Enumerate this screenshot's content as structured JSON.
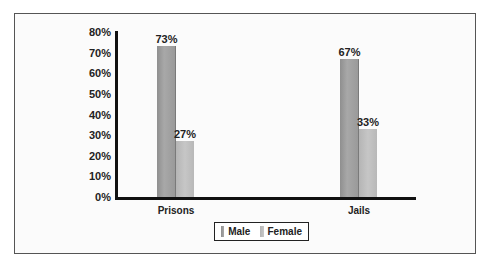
{
  "chart_data": {
    "type": "bar",
    "title": "",
    "xlabel": "",
    "ylabel": "",
    "categories": [
      "Prisons",
      "Jails"
    ],
    "series": [
      {
        "name": "Male",
        "values": [
          73,
          67
        ],
        "color": "#9a9a9a"
      },
      {
        "name": "Female",
        "values": [
          27,
          33
        ],
        "color": "#c0c0c0"
      }
    ],
    "value_labels": {
      "Male": [
        "73%",
        "67%"
      ],
      "Female": [
        "27%",
        "33%"
      ]
    },
    "ylim": [
      0,
      80
    ],
    "yticks": [
      "0%",
      "10%",
      "20%",
      "30%",
      "40%",
      "50%",
      "60%",
      "70%",
      "80%"
    ],
    "grid": false,
    "legend_position": "bottom"
  },
  "legend": {
    "male": "Male",
    "female": "Female"
  }
}
